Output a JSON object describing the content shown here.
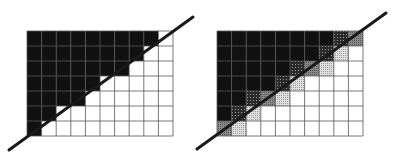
{
  "figure": {
    "grid": {
      "cols": 10,
      "rows": 7
    }
  },
  "colors": {
    "black": "#111111",
    "dark": "#3a3a3a",
    "medium": "#7a7a7a",
    "light": "#c4c4c4",
    "white": "#ffffff",
    "gridline": "#555555",
    "line": "#1a1a1a"
  },
  "panels": [
    {
      "name": "aliased",
      "x": 27,
      "y": 31,
      "width": 146,
      "height": 105,
      "line": {
        "x1": 9,
        "y1": 150,
        "x2": 193,
        "y2": 17
      },
      "rows": [
        [
          "k",
          "k",
          "k",
          "k",
          "k",
          "k",
          "k",
          "k",
          "k",
          "w"
        ],
        [
          "k",
          "k",
          "k",
          "k",
          "k",
          "k",
          "k",
          "k",
          "w",
          "w"
        ],
        [
          "k",
          "k",
          "k",
          "k",
          "k",
          "k",
          "k",
          "w",
          "w",
          "w"
        ],
        [
          "k",
          "k",
          "k",
          "k",
          "k",
          "w",
          "w",
          "w",
          "w",
          "w"
        ],
        [
          "k",
          "k",
          "k",
          "k",
          "w",
          "w",
          "w",
          "w",
          "w",
          "w"
        ],
        [
          "k",
          "k",
          "w",
          "w",
          "w",
          "w",
          "w",
          "w",
          "w",
          "w"
        ],
        [
          "k",
          "w",
          "w",
          "w",
          "w",
          "w",
          "w",
          "w",
          "w",
          "w"
        ]
      ]
    },
    {
      "name": "antialiased",
      "x": 217,
      "y": 31,
      "width": 146,
      "height": 105,
      "line": {
        "x1": 197,
        "y1": 149,
        "x2": 386,
        "y2": 13
      },
      "rows": [
        [
          "k",
          "k",
          "k",
          "k",
          "k",
          "k",
          "k",
          "k",
          "d",
          "m"
        ],
        [
          "k",
          "k",
          "k",
          "k",
          "k",
          "k",
          "k",
          "d",
          "l",
          "w"
        ],
        [
          "k",
          "k",
          "k",
          "k",
          "k",
          "d",
          "m",
          "l",
          "w",
          "w"
        ],
        [
          "k",
          "k",
          "k",
          "k",
          "d",
          "l",
          "w",
          "w",
          "w",
          "w"
        ],
        [
          "k",
          "k",
          "d",
          "m",
          "l",
          "w",
          "w",
          "w",
          "w",
          "w"
        ],
        [
          "k",
          "d",
          "l",
          "w",
          "w",
          "w",
          "w",
          "w",
          "w",
          "w"
        ],
        [
          "m",
          "l",
          "w",
          "w",
          "w",
          "w",
          "w",
          "w",
          "w",
          "w"
        ]
      ]
    }
  ]
}
